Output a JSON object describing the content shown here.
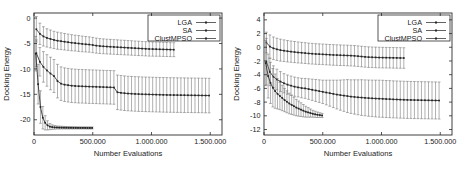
{
  "figure": {
    "panels": [
      {
        "name": "left-panel",
        "chart_data": {
          "type": "line",
          "title": "",
          "xlabel": "Number Evaluations",
          "ylabel": "Docking Energy",
          "xlim": [
            0,
            1600000
          ],
          "ylim": [
            -23,
            1
          ],
          "xticks": [
            0,
            500000,
            1000000,
            1500000
          ],
          "xticklabels": [
            "0",
            "500.000",
            "1.000.000",
            "1.500.000"
          ],
          "yticks": [
            0,
            -5,
            -10,
            -15,
            -20
          ],
          "yticklabels": [
            "0",
            "-5",
            "-10",
            "-15",
            "-20"
          ],
          "grid": false,
          "legend_position": "top-right",
          "legend": [
            "LGA",
            "SA",
            "ClustMPSO"
          ],
          "series": [
            {
              "name": "LGA",
              "x": [
                20000,
                50000,
                80000,
                110000,
                140000,
                170000,
                200000,
                230000,
                260000,
                290000,
                320000,
                350000,
                380000,
                410000,
                440000,
                470000,
                500000,
                530000,
                560000,
                590000,
                620000,
                650000,
                680000,
                710000,
                740000,
                770000,
                800000,
                830000,
                860000,
                890000,
                920000,
                950000,
                980000,
                1010000,
                1040000,
                1070000,
                1100000,
                1130000,
                1160000,
                1190000
              ],
              "y": [
                -2.2,
                -3.1,
                -3.6,
                -3.9,
                -4.1,
                -4.3,
                -4.45,
                -4.55,
                -4.65,
                -4.75,
                -4.85,
                -4.92,
                -5.0,
                -5.08,
                -5.15,
                -5.2,
                -5.3,
                -5.42,
                -5.5,
                -5.55,
                -5.6,
                -5.64,
                -5.68,
                -5.72,
                -5.76,
                -5.8,
                -5.84,
                -5.88,
                -5.92,
                -5.96,
                -6.0,
                -6.04,
                -6.08,
                -6.1,
                -6.12,
                -6.14,
                -6.16,
                -6.18,
                -6.2,
                -6.22
              ],
              "err": [
                2.5,
                2.1,
                1.9,
                1.8,
                1.75,
                1.7,
                1.68,
                1.65,
                1.62,
                1.6,
                1.58,
                1.56,
                1.55,
                1.54,
                1.52,
                1.5,
                1.5,
                1.48,
                1.47,
                1.46,
                1.45,
                1.45,
                1.44,
                1.44,
                1.43,
                1.43,
                1.42,
                1.42,
                1.41,
                1.41,
                1.4,
                1.4,
                1.4,
                1.39,
                1.39,
                1.38,
                1.38,
                1.38,
                1.37,
                1.37
              ]
            },
            {
              "name": "SA",
              "x": [
                20000,
                50000,
                80000,
                110000,
                140000,
                170000,
                200000,
                230000,
                260000,
                290000,
                320000,
                350000,
                380000,
                410000,
                440000,
                470000,
                500000,
                530000,
                560000,
                590000,
                620000,
                650000,
                680000,
                710000,
                740000,
                770000,
                800000,
                830000,
                860000,
                890000,
                920000,
                950000,
                980000,
                1010000,
                1040000,
                1070000,
                1100000,
                1130000,
                1160000,
                1190000,
                1220000,
                1250000,
                1280000,
                1310000,
                1340000,
                1370000,
                1400000,
                1430000,
                1460000,
                1490000
              ],
              "y": [
                -6.9,
                -8.6,
                -9.6,
                -10.3,
                -10.9,
                -11.4,
                -12.4,
                -12.9,
                -13.1,
                -13.2,
                -13.3,
                -13.35,
                -13.4,
                -13.42,
                -13.45,
                -13.48,
                -13.5,
                -13.52,
                -13.55,
                -13.57,
                -13.6,
                -13.62,
                -13.65,
                -14.6,
                -14.7,
                -14.78,
                -14.84,
                -14.88,
                -14.92,
                -14.95,
                -14.98,
                -15.0,
                -15.02,
                -15.04,
                -15.06,
                -15.08,
                -15.1,
                -15.12,
                -15.13,
                -15.14,
                -15.15,
                -15.16,
                -15.17,
                -15.18,
                -15.19,
                -15.2,
                -15.21,
                -15.22,
                -15.23,
                -15.24
              ],
              "err": [
                2.6,
                2.8,
                3.0,
                3.1,
                3.2,
                3.25,
                3.3,
                3.3,
                3.3,
                3.3,
                3.3,
                3.3,
                3.3,
                3.3,
                3.3,
                3.3,
                3.3,
                3.3,
                3.3,
                3.3,
                3.3,
                3.3,
                3.3,
                3.4,
                3.4,
                3.4,
                3.4,
                3.4,
                3.4,
                3.4,
                3.4,
                3.4,
                3.4,
                3.4,
                3.4,
                3.4,
                3.4,
                3.4,
                3.4,
                3.4,
                3.4,
                3.4,
                3.4,
                3.4,
                3.4,
                3.4,
                3.4,
                3.4,
                3.4,
                3.4
              ]
            },
            {
              "name": "ClustMPSO",
              "x": [
                15000,
                35000,
                55000,
                75000,
                95000,
                115000,
                135000,
                155000,
                175000,
                195000,
                215000,
                235000,
                255000,
                275000,
                295000,
                315000,
                335000,
                355000,
                375000,
                395000,
                415000,
                435000,
                455000,
                475000,
                495000
              ],
              "y": [
                -7.0,
                -13.0,
                -17.5,
                -19.6,
                -20.6,
                -21.1,
                -21.35,
                -21.45,
                -21.5,
                -21.52,
                -21.54,
                -21.55,
                -21.56,
                -21.57,
                -21.58,
                -21.58,
                -21.59,
                -21.59,
                -21.6,
                -21.6,
                -21.6,
                -21.6,
                -21.61,
                -21.61,
                -21.61
              ],
              "err": [
                3.4,
                3.9,
                3.2,
                2.2,
                1.4,
                0.9,
                0.6,
                0.45,
                0.35,
                0.3,
                0.28,
                0.26,
                0.25,
                0.24,
                0.23,
                0.22,
                0.22,
                0.21,
                0.21,
                0.2,
                0.2,
                0.2,
                0.2,
                0.2,
                0.2
              ]
            }
          ]
        }
      },
      {
        "name": "right-panel",
        "chart_data": {
          "type": "line",
          "title": "",
          "xlabel": "Number Evaluations",
          "ylabel": "Docking Energy",
          "xlim": [
            0,
            1600000
          ],
          "ylim": [
            -12.8,
            5
          ],
          "xticks": [
            0,
            500000,
            1000000,
            1500000
          ],
          "xticklabels": [
            "0",
            "500.000",
            "1.000.000",
            "1.500.000"
          ],
          "yticks": [
            4,
            2,
            0,
            -2,
            -4,
            -6,
            -8,
            -10,
            -12
          ],
          "yticklabels": [
            "4",
            "2",
            "0",
            "-2",
            "-4",
            "-6",
            "-8",
            "-10",
            "-12"
          ],
          "grid": false,
          "legend_position": "top-right",
          "legend": [
            "LGA",
            "SA",
            "ClustMPSO"
          ],
          "series": [
            {
              "name": "LGA",
              "x": [
                20000,
                50000,
                80000,
                110000,
                140000,
                170000,
                200000,
                230000,
                260000,
                290000,
                320000,
                350000,
                380000,
                410000,
                440000,
                470000,
                500000,
                530000,
                560000,
                590000,
                620000,
                650000,
                680000,
                710000,
                740000,
                770000,
                800000,
                830000,
                860000,
                890000,
                920000,
                950000,
                980000,
                1010000,
                1040000,
                1070000,
                1100000,
                1130000,
                1160000,
                1190000
              ],
              "y": [
                0.7,
                0.1,
                -0.15,
                -0.3,
                -0.42,
                -0.5,
                -0.58,
                -0.64,
                -0.7,
                -0.76,
                -0.8,
                -0.85,
                -0.9,
                -0.94,
                -0.98,
                -1.0,
                -1.03,
                -1.06,
                -1.09,
                -1.12,
                -1.14,
                -1.16,
                -1.18,
                -1.2,
                -1.22,
                -1.25,
                -1.3,
                -1.35,
                -1.4,
                -1.44,
                -1.46,
                -1.48,
                -1.5,
                -1.51,
                -1.52,
                -1.53,
                -1.54,
                -1.55,
                -1.56,
                -1.57
              ],
              "err": [
                1.5,
                1.7,
                1.65,
                1.62,
                1.6,
                1.58,
                1.56,
                1.55,
                1.54,
                1.53,
                1.52,
                1.52,
                1.51,
                1.51,
                1.5,
                1.5,
                1.5,
                1.5,
                1.5,
                1.5,
                1.5,
                1.5,
                1.5,
                1.5,
                1.5,
                1.5,
                1.5,
                1.5,
                1.5,
                1.5,
                1.5,
                1.5,
                1.5,
                1.5,
                1.5,
                1.5,
                1.5,
                1.5,
                1.5,
                1.5
              ]
            },
            {
              "name": "SA",
              "x": [
                20000,
                50000,
                80000,
                110000,
                140000,
                170000,
                200000,
                230000,
                260000,
                290000,
                320000,
                350000,
                380000,
                410000,
                440000,
                470000,
                500000,
                530000,
                560000,
                590000,
                620000,
                650000,
                680000,
                710000,
                740000,
                770000,
                800000,
                830000,
                860000,
                890000,
                920000,
                950000,
                980000,
                1010000,
                1040000,
                1070000,
                1100000,
                1130000,
                1160000,
                1190000,
                1220000,
                1250000,
                1280000,
                1310000,
                1340000,
                1370000,
                1400000,
                1430000,
                1460000,
                1490000
              ],
              "y": [
                -2.1,
                -3.6,
                -4.3,
                -4.7,
                -5.0,
                -5.25,
                -5.45,
                -5.6,
                -5.75,
                -5.85,
                -5.95,
                -6.0,
                -6.1,
                -6.2,
                -6.3,
                -6.4,
                -6.5,
                -6.6,
                -6.7,
                -6.8,
                -6.9,
                -6.98,
                -7.05,
                -7.12,
                -7.2,
                -7.25,
                -7.3,
                -7.34,
                -7.38,
                -7.42,
                -7.45,
                -7.48,
                -7.5,
                -7.52,
                -7.55,
                -7.57,
                -7.6,
                -7.62,
                -7.64,
                -7.66,
                -7.68,
                -7.69,
                -7.7,
                -7.71,
                -7.72,
                -7.73,
                -7.74,
                -7.75,
                -7.76,
                -7.77
              ],
              "err": [
                3.4,
                2.0,
                1.6,
                1.5,
                1.45,
                1.4,
                1.4,
                1.4,
                1.4,
                1.4,
                1.42,
                1.45,
                1.5,
                1.55,
                1.6,
                1.65,
                1.7,
                1.8,
                1.9,
                2.0,
                2.1,
                2.2,
                2.3,
                2.4,
                2.45,
                2.5,
                2.55,
                2.6,
                2.62,
                2.64,
                2.66,
                2.68,
                2.7,
                2.7,
                2.7,
                2.7,
                2.7,
                2.7,
                2.7,
                2.7,
                2.7,
                2.7,
                2.7,
                2.7,
                2.7,
                2.7,
                2.7,
                2.7,
                2.7,
                2.7
              ]
            },
            {
              "name": "ClustMPSO",
              "x": [
                15000,
                35000,
                55000,
                75000,
                95000,
                115000,
                135000,
                155000,
                175000,
                195000,
                215000,
                235000,
                255000,
                275000,
                295000,
                315000,
                335000,
                355000,
                375000,
                395000,
                415000,
                435000,
                455000,
                475000,
                495000
              ],
              "y": [
                -2.3,
                -4.2,
                -5.2,
                -5.9,
                -6.4,
                -6.8,
                -7.1,
                -7.4,
                -7.7,
                -7.95,
                -8.2,
                -8.4,
                -8.6,
                -8.8,
                -8.95,
                -9.1,
                -9.25,
                -9.4,
                -9.5,
                -9.6,
                -9.7,
                -9.78,
                -9.85,
                -9.9,
                -9.95
              ],
              "err": [
                3.3,
                3.2,
                3.0,
                2.8,
                2.5,
                2.2,
                2.0,
                1.85,
                1.7,
                1.6,
                1.5,
                1.4,
                1.3,
                1.2,
                1.1,
                1.0,
                0.9,
                0.8,
                0.7,
                0.6,
                0.5,
                0.45,
                0.4,
                0.35,
                0.3
              ]
            }
          ]
        }
      }
    ]
  }
}
